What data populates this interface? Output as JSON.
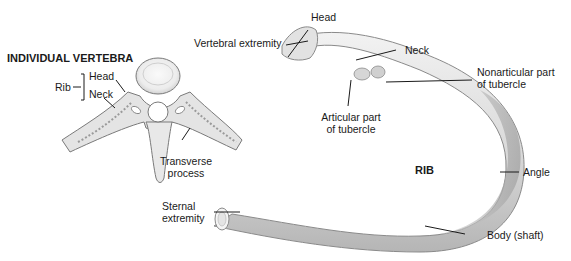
{
  "figure": {
    "vertebra_panel": {
      "title": "INDIVIDUAL VERTEBRA",
      "rib_bracket_label": "Rib",
      "rib_parts": [
        "Head",
        "Neck"
      ],
      "transverse_process_label": [
        "Transverse",
        "process"
      ]
    },
    "rib_panel": {
      "title": "RIB",
      "labels": {
        "head": "Head",
        "vertebral_extremity": "Vertebral extremity",
        "neck": "Neck",
        "nonarticular": [
          "Nonarticular part",
          "of tubercle"
        ],
        "articular": [
          "Articular part",
          "of tubercle"
        ],
        "angle": "Angle",
        "sternal": [
          "Sternal",
          "extremity"
        ],
        "body": "Body (shaft)"
      }
    },
    "colors": {
      "bone_fill": "#e6e6e6",
      "bone_shade": "#bdbdbd",
      "bone_outline": "#8a8a8a",
      "leader_line": "#1a1a1a"
    }
  }
}
